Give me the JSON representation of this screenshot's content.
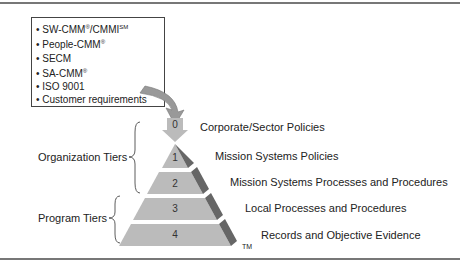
{
  "sources": {
    "items": [
      {
        "text": "SW-CMM",
        "sup1": "®",
        "rest": "/CMMI",
        "sup2": "SM"
      },
      {
        "text": "People-CMM",
        "sup1": "®",
        "rest": "",
        "sup2": ""
      },
      {
        "text": "SECM",
        "sup1": "",
        "rest": "",
        "sup2": ""
      },
      {
        "text": "SA-CMM",
        "sup1": "®",
        "rest": "",
        "sup2": ""
      },
      {
        "text": "ISO 9001",
        "sup1": "",
        "rest": "",
        "sup2": ""
      },
      {
        "text": "Customer requirements",
        "sup1": "",
        "rest": "",
        "sup2": ""
      }
    ]
  },
  "tiers": [
    {
      "num": "0",
      "label": "Corporate/Sector Policies"
    },
    {
      "num": "1",
      "label": "Mission Systems Policies"
    },
    {
      "num": "2",
      "label": "Mission Systems Processes and Procedures"
    },
    {
      "num": "3",
      "label": "Local Processes and Procedures"
    },
    {
      "num": "4",
      "label": "Records and Objective Evidence"
    }
  ],
  "groups": {
    "organization": "Organization Tiers",
    "program": "Program Tiers"
  },
  "trademark": "TM"
}
